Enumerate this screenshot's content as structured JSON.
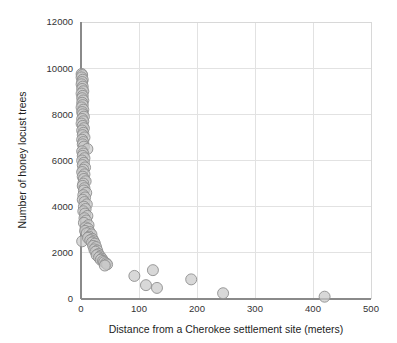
{
  "chart_data": {
    "type": "scatter",
    "title": "",
    "xlabel": "Distance from a Cherokee settlement site (meters)",
    "ylabel": "Number of  honey locust trees",
    "xlim": [
      0,
      500
    ],
    "ylim": [
      0,
      12000
    ],
    "xticks": [
      0,
      100,
      200,
      300,
      400,
      500
    ],
    "yticks": [
      0,
      2000,
      4000,
      6000,
      8000,
      10000,
      12000
    ],
    "xtick_labels": [
      "0",
      "100",
      "200",
      "300",
      "400",
      "500"
    ],
    "ytick_labels": [
      "0",
      "2000",
      "4000",
      "6000",
      "8000",
      "10000",
      "12000"
    ],
    "grid": true,
    "grid_axis": "both",
    "legend": "none",
    "marker": {
      "shape": "circle",
      "fill_color": "#c9c9c9",
      "edge_color": "#8f8f8f",
      "opacity": 0.72,
      "size_px": 11
    },
    "series": [
      {
        "name": "honey locust trees vs distance",
        "points": [
          [
            1,
            9750
          ],
          [
            2,
            9700
          ],
          [
            1,
            9600
          ],
          [
            3,
            9500
          ],
          [
            2,
            9400
          ],
          [
            1,
            9300
          ],
          [
            3,
            9200
          ],
          [
            2,
            9100
          ],
          [
            4,
            9000
          ],
          [
            1,
            8900
          ],
          [
            3,
            8800
          ],
          [
            2,
            8700
          ],
          [
            4,
            8600
          ],
          [
            2,
            8500
          ],
          [
            3,
            8400
          ],
          [
            1,
            8300
          ],
          [
            4,
            8200
          ],
          [
            2,
            8100
          ],
          [
            3,
            8000
          ],
          [
            5,
            7900
          ],
          [
            2,
            7800
          ],
          [
            4,
            7700
          ],
          [
            1,
            7600
          ],
          [
            3,
            7500
          ],
          [
            5,
            7400
          ],
          [
            2,
            7300
          ],
          [
            4,
            7200
          ],
          [
            3,
            7100
          ],
          [
            6,
            7000
          ],
          [
            2,
            6900
          ],
          [
            4,
            6800
          ],
          [
            3,
            6700
          ],
          [
            5,
            6600
          ],
          [
            11,
            6500
          ],
          [
            2,
            6400
          ],
          [
            4,
            6300
          ],
          [
            3,
            6200
          ],
          [
            6,
            6100
          ],
          [
            2,
            6000
          ],
          [
            5,
            5900
          ],
          [
            3,
            5800
          ],
          [
            7,
            5700
          ],
          [
            4,
            5600
          ],
          [
            2,
            5500
          ],
          [
            6,
            5400
          ],
          [
            3,
            5300
          ],
          [
            5,
            5200
          ],
          [
            8,
            5100
          ],
          [
            4,
            5000
          ],
          [
            3,
            4900
          ],
          [
            6,
            4800
          ],
          [
            5,
            4700
          ],
          [
            9,
            4600
          ],
          [
            4,
            4500
          ],
          [
            7,
            4400
          ],
          [
            3,
            4300
          ],
          [
            6,
            4200
          ],
          [
            10,
            4100
          ],
          [
            5,
            4000
          ],
          [
            8,
            3900
          ],
          [
            4,
            3800
          ],
          [
            7,
            3700
          ],
          [
            11,
            3600
          ],
          [
            6,
            3500
          ],
          [
            9,
            3400
          ],
          [
            5,
            3300
          ],
          [
            13,
            3200
          ],
          [
            8,
            3100
          ],
          [
            12,
            3050
          ],
          [
            7,
            2950
          ],
          [
            2,
            2500
          ],
          [
            15,
            2900
          ],
          [
            10,
            2850
          ],
          [
            18,
            2800
          ],
          [
            14,
            2700
          ],
          [
            12,
            2650
          ],
          [
            20,
            2600
          ],
          [
            16,
            2550
          ],
          [
            22,
            2500
          ],
          [
            19,
            2450
          ],
          [
            24,
            2400
          ],
          [
            21,
            2300
          ],
          [
            26,
            2250
          ],
          [
            23,
            2150
          ],
          [
            28,
            2100
          ],
          [
            25,
            2050
          ],
          [
            30,
            1950
          ],
          [
            27,
            1900
          ],
          [
            33,
            1850
          ],
          [
            31,
            1800
          ],
          [
            36,
            1750
          ],
          [
            34,
            1700
          ],
          [
            38,
            1650
          ],
          [
            40,
            1600
          ],
          [
            43,
            1550
          ],
          [
            45,
            1500
          ],
          [
            41,
            1450
          ],
          [
            92,
            1000
          ],
          [
            112,
            600
          ],
          [
            124,
            1250
          ],
          [
            131,
            480
          ],
          [
            190,
            850
          ],
          [
            245,
            250
          ],
          [
            420,
            100
          ]
        ]
      }
    ]
  },
  "axis": {
    "x_title": "Distance from a Cherokee settlement site (meters)",
    "y_title": "Number of  honey locust trees"
  }
}
